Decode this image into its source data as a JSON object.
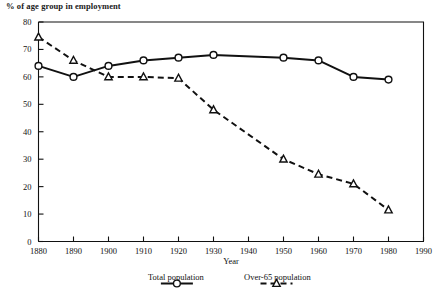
{
  "chart_data": {
    "type": "line",
    "title": "",
    "ylabel": "% of age group in employment",
    "xlabel": "Year",
    "x": [
      1880,
      1890,
      1900,
      1910,
      1920,
      1930,
      1940,
      1950,
      1960,
      1970,
      1980
    ],
    "xlim": [
      1880,
      1990
    ],
    "ylim": [
      0,
      80
    ],
    "xticks": [
      1880,
      1890,
      1900,
      1910,
      1920,
      1930,
      1940,
      1950,
      1960,
      1970,
      1980,
      1990
    ],
    "yticks": [
      0,
      10,
      20,
      30,
      40,
      50,
      60,
      70,
      80
    ],
    "grid": false,
    "legend_position": "below-axis",
    "series": [
      {
        "name": "Total population",
        "marker": "circle",
        "linestyle": "solid",
        "color": "#111111",
        "x": [
          1880,
          1890,
          1900,
          1910,
          1920,
          1930,
          1950,
          1960,
          1970,
          1980
        ],
        "values": [
          64,
          60,
          64,
          66,
          67,
          68,
          67,
          66,
          60,
          59
        ]
      },
      {
        "name": "Over-65 population",
        "marker": "triangle",
        "linestyle": "dashed",
        "color": "#111111",
        "x": [
          1880,
          1890,
          1900,
          1910,
          1920,
          1930,
          1950,
          1960,
          1970,
          1980
        ],
        "values": [
          74.5,
          66,
          60,
          60,
          59.5,
          48,
          30,
          24.5,
          21,
          11.5
        ]
      }
    ]
  },
  "axes": {
    "y_title": "% of age group in employment",
    "x_title": "Year",
    "y_tick_labels": [
      "80",
      "70",
      "60",
      "50",
      "40",
      "30",
      "20",
      "10",
      "0"
    ],
    "x_tick_labels": [
      "1880",
      "1890",
      "1900",
      "1910",
      "1920",
      "1930",
      "1940",
      "1950",
      "1960",
      "1970",
      "1980",
      "1990"
    ]
  },
  "legend": {
    "items": [
      {
        "label": "Total population",
        "marker": "circle",
        "linestyle": "solid"
      },
      {
        "label": "Over-65 population",
        "marker": "triangle",
        "linestyle": "dashed"
      }
    ]
  },
  "colors": {
    "ink": "#111111",
    "background": "#ffffff"
  }
}
